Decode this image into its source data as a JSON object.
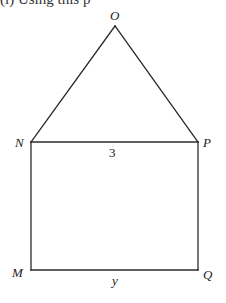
{
  "caption_fragment": "(i) Using this p",
  "figure": {
    "stroke_color": "#2a2a2a",
    "vertices": {
      "O": {
        "label": "O",
        "x": 115,
        "y": 26
      },
      "N": {
        "label": "N",
        "x": 31,
        "y": 142
      },
      "P": {
        "label": "P",
        "x": 198,
        "y": 142
      },
      "M": {
        "label": "M",
        "x": 31,
        "y": 270
      },
      "Q": {
        "label": "Q",
        "x": 198,
        "y": 270
      }
    },
    "segments": [
      {
        "from": "O",
        "to": "N"
      },
      {
        "from": "O",
        "to": "P"
      },
      {
        "from": "N",
        "to": "P",
        "length_label": "3"
      },
      {
        "from": "N",
        "to": "M"
      },
      {
        "from": "P",
        "to": "Q"
      },
      {
        "from": "M",
        "to": "Q",
        "length_label": "y"
      }
    ],
    "side_labels": {
      "NP": "3",
      "MQ": "y"
    }
  }
}
